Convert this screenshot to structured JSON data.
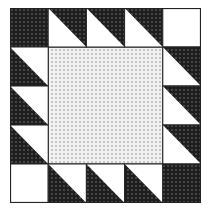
{
  "grid": {
    "rows": 5,
    "cols": 5
  },
  "colors": {
    "dark": "#1e1e1e",
    "light_fill": "#ececec",
    "white": "#ffffff",
    "line": "#222222"
  },
  "cells": [
    [
      "dark",
      "tri-tr-dark",
      "tri-tr-dark",
      "tri-tr-dark",
      "white"
    ],
    [
      "tri-bl-dark",
      "center",
      "center",
      "center",
      "tri-tr-dark"
    ],
    [
      "tri-bl-dark",
      "center",
      "center",
      "center",
      "tri-tr-dark"
    ],
    [
      "tri-bl-dark",
      "center",
      "center",
      "center",
      "tri-tr-dark"
    ],
    [
      "white",
      "tri-bl-dark",
      "tri-bl-dark",
      "tri-bl-dark",
      "dark"
    ]
  ]
}
